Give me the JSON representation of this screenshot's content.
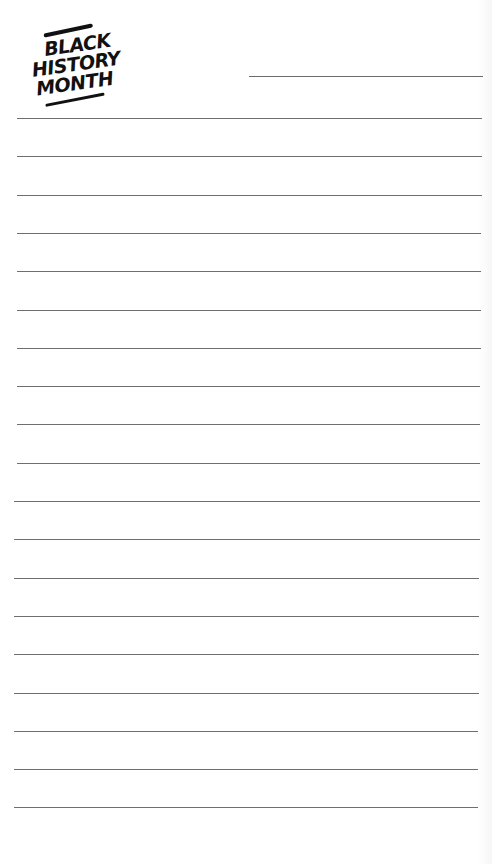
{
  "logo": {
    "lines": [
      "BLACK",
      "HISTORY",
      "MONTH"
    ]
  },
  "header": {
    "name_line": ""
  },
  "rules": {
    "count": 19,
    "first_y": 118,
    "spacing": 38.3,
    "color": "#6f6f6f"
  }
}
